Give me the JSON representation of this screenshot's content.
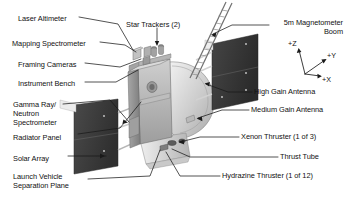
{
  "figure": {
    "background_color": "#ffffff",
    "line_color": "#1a1a1a",
    "text_color": "#111111"
  },
  "callouts_left": [
    {
      "id": "laser-altimeter",
      "text": "Laser Altimeter",
      "x": 18,
      "y": 14
    },
    {
      "id": "mapping-spectrometer",
      "text": "Mapping Spectrometer",
      "x": 12,
      "y": 39
    },
    {
      "id": "framing-cameras",
      "text": "Framing Cameras",
      "x": 18,
      "y": 60
    },
    {
      "id": "instrument-bench",
      "text": "Instrument Bench",
      "x": 18,
      "y": 79
    },
    {
      "id": "gamma-ray-neutron-spectrometer",
      "text": "Gamma Ray/\nNeutron\nSpectrometer",
      "x": 13,
      "y": 100
    },
    {
      "id": "radiator-panel",
      "text": "Radiator Panel",
      "x": 13,
      "y": 133
    },
    {
      "id": "solar-array",
      "text": "Solar Array",
      "x": 13,
      "y": 154
    },
    {
      "id": "launch-vehicle-separation-plane",
      "text": "Launch Vehicle\nSeparation Plane",
      "x": 13,
      "y": 172
    }
  ],
  "callouts_top": [
    {
      "id": "star-trackers",
      "text": "Star Trackers (2)",
      "x": 126,
      "y": 20
    }
  ],
  "callouts_right": [
    {
      "id": "magnetometer-boom",
      "text": "5m Magnetometer\nBoom",
      "x": 271,
      "y": 18,
      "align": "right"
    },
    {
      "id": "high-gain-antenna",
      "text": "High Gain Antenna",
      "x": 254,
      "y": 89,
      "align": "left"
    },
    {
      "id": "medium-gain-antenna",
      "text": "Medium Gain Antenna",
      "x": 251,
      "y": 107,
      "align": "left"
    },
    {
      "id": "xenon-thruster",
      "text": "Xenon Thruster (1 of 3)",
      "x": 241,
      "y": 134,
      "align": "left"
    },
    {
      "id": "thrust-tube",
      "text": "Thrust Tube",
      "x": 280,
      "y": 154,
      "align": "left"
    },
    {
      "id": "hydrazine-thruster",
      "text": "Hydrazine Thruster (1 of 12)",
      "x": 222,
      "y": 173,
      "align": "left"
    }
  ],
  "axis_indicator": {
    "id": "coordinate-axes",
    "origin_x": 305,
    "origin_y": 74,
    "axes": [
      {
        "label": "+Z",
        "lx": 290,
        "ly": 43
      },
      {
        "label": "+Y",
        "lx": 327,
        "ly": 55
      },
      {
        "label": "+X",
        "lx": 322,
        "ly": 79
      }
    ]
  },
  "spacecraft": {
    "bus_color": "#b6b6b6",
    "bus_shade_color": "#8e8e8e",
    "panel_color": "#3d3d3d",
    "dish_color": "#d8d8d8",
    "boom_color": "#e8e8e8"
  }
}
